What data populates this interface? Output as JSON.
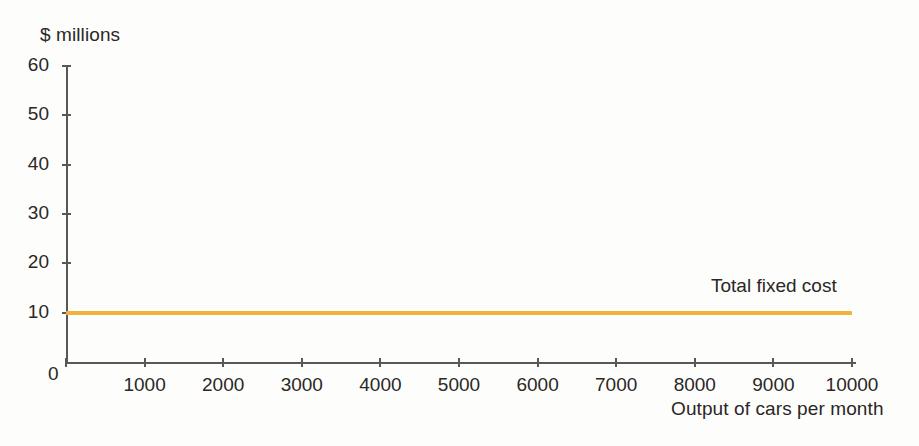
{
  "chart_data": {
    "type": "line",
    "title": "",
    "subtitle": "",
    "xlabel": "Output of cars per month",
    "ylabel": "$ millions",
    "xlim": [
      0,
      10000
    ],
    "ylim": [
      0,
      60
    ],
    "grid": false,
    "legend_position": "inline-right",
    "x_ticks": [
      0,
      1000,
      2000,
      3000,
      4000,
      5000,
      6000,
      7000,
      8000,
      9000,
      10000
    ],
    "x_tick_labels": [
      "0",
      "1000",
      "2000",
      "3000",
      "4000",
      "5000",
      "6000",
      "7000",
      "8000",
      "9000",
      "10000"
    ],
    "y_ticks": [
      0,
      10,
      20,
      30,
      40,
      50,
      60
    ],
    "y_tick_labels": [
      "0",
      "10",
      "20",
      "30",
      "40",
      "50",
      "60"
    ],
    "series": [
      {
        "name": "Total fixed cost",
        "color": "#f2b23e",
        "x": [
          0,
          1000,
          2000,
          3000,
          4000,
          5000,
          6000,
          7000,
          8000,
          9000,
          10000
        ],
        "values": [
          10,
          10,
          10,
          10,
          10,
          10,
          10,
          10,
          10,
          10,
          10
        ]
      }
    ],
    "annotations": [
      {
        "text": "Total fixed cost",
        "x": 8200,
        "y": 11.8
      }
    ]
  },
  "axes": {
    "y_title": "$ millions",
    "x_title": "Output of cars per month",
    "origin_label": "0"
  },
  "colors": {
    "series_fixed_cost": "#f2b23e",
    "axis": "#5a5755",
    "text": "#2a2726",
    "background": "#fdfdfc"
  }
}
